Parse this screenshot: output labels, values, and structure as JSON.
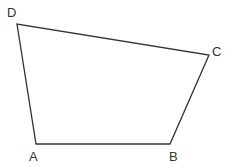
{
  "diagram": {
    "type": "quadrilateral",
    "stroke_color": "#333333",
    "vertices": [
      {
        "label": "A",
        "x": 36,
        "y": 144
      },
      {
        "label": "B",
        "x": 170,
        "y": 144
      },
      {
        "label": "C",
        "x": 209,
        "y": 55
      },
      {
        "label": "D",
        "x": 17,
        "y": 24
      }
    ],
    "labels": {
      "A": "A",
      "B": "B",
      "C": "C",
      "D": "D"
    }
  }
}
